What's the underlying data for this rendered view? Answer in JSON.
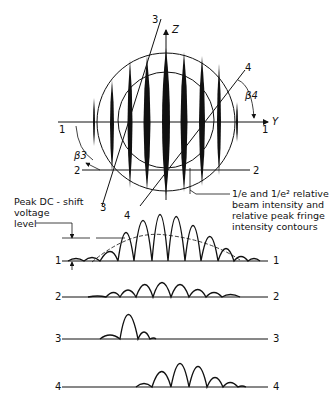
{
  "diagram": {
    "axes": {
      "z_label": "Z",
      "y_label": "Y"
    },
    "section_lines": [
      {
        "id": "1",
        "left_label": "1",
        "right_label": "1",
        "type": "horizontal through center"
      },
      {
        "id": "2",
        "left_label": "2",
        "right_label": "2",
        "type": "horizontal below center"
      },
      {
        "id": "3",
        "end_label_top": "3",
        "end_label_bottom": "3",
        "type": "steep diagonal"
      },
      {
        "id": "4",
        "end_label_top": "4",
        "end_label_bottom": "4",
        "type": "45-degree diagonal"
      }
    ],
    "angles": {
      "beta3": "β3",
      "beta4": "β4"
    },
    "annotations": {
      "contours": "1/e and 1/e² relative beam intensity and relative peak fringe intensity contours",
      "contours_lines": [
        "1/e and 1/e² relative",
        "beam intensity and",
        "relative peak fringe",
        "intensity contours"
      ],
      "dc_shift_lines": [
        "Peak DC - shift",
        "voltage",
        "level"
      ]
    },
    "waveforms": [
      {
        "label_left": "1",
        "label_right": "1",
        "fringes": 11,
        "has_envelope": true
      },
      {
        "label_left": "2",
        "label_right": "2",
        "fringes": 9
      },
      {
        "label_left": "3",
        "label_right": "3",
        "fringes": 3
      },
      {
        "label_left": "4",
        "label_right": "4",
        "fringes": 6
      }
    ],
    "colors": {
      "ink": "#111111",
      "background": "#ffffff"
    }
  }
}
